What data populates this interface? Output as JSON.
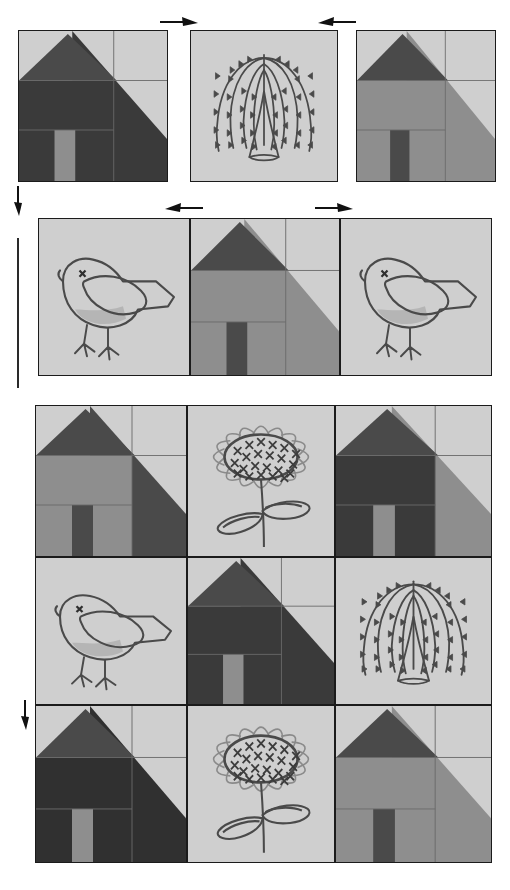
{
  "document": {
    "type": "quilt-block-layout-diagram",
    "title": "Schoolhouse quilt assembly diagram",
    "description": "Rows of pieced house blocks alternating with appliqued willow, bird and sunflower blocks, with arrows showing seam pressing directions."
  },
  "palette": {
    "fabric_light": "#cfcfcf",
    "fabric_light2": "#c4c4c4",
    "fabric_mid": "#8e8e8e",
    "fabric_mid_dark": "#7a7a7a",
    "fabric_dark": "#4a4a4a",
    "fabric_darker": "#3a3a3a",
    "fabric_darkest": "#303030",
    "outline": "#1b1b1b",
    "applique_line": "#4a4a4a",
    "arrow": "#111111",
    "background": "#ffffff"
  },
  "rows": [
    {
      "id": "row-1",
      "label": "Row 1",
      "blocks": [
        {
          "id": "r1c1",
          "kind": "house",
          "name": "house-block-dark",
          "roof": "#4a4a4a",
          "wall": "#3a3a3a",
          "door": "#8e8e8e",
          "sky": "#cfcfcf",
          "side": "#3a3a3a",
          "x": 18,
          "y": 30,
          "w": 150,
          "h": 152
        },
        {
          "id": "r1c2",
          "kind": "willow",
          "name": "willow-tree-block",
          "ground": "#cfcfcf",
          "x": 190,
          "y": 30,
          "w": 148,
          "h": 152
        },
        {
          "id": "r1c3",
          "kind": "house",
          "name": "house-block-mid",
          "roof": "#4a4a4a",
          "wall": "#8e8e8e",
          "door": "#4a4a4a",
          "sky": "#cfcfcf",
          "side": "#8e8e8e",
          "x": 356,
          "y": 30,
          "w": 140,
          "h": 152
        }
      ]
    },
    {
      "id": "row-2",
      "label": "Row 2",
      "blocks": [
        {
          "id": "r2c1",
          "kind": "bird",
          "name": "bird-block",
          "ground": "#cfcfcf",
          "x": 38,
          "y": 218,
          "w": 152,
          "h": 158
        },
        {
          "id": "r2c2",
          "kind": "house",
          "name": "house-block-mid",
          "roof": "#4a4a4a",
          "wall": "#8e8e8e",
          "door": "#4a4a4a",
          "sky": "#cfcfcf",
          "side": "#8e8e8e",
          "x": 190,
          "y": 218,
          "w": 150,
          "h": 158
        },
        {
          "id": "r2c3",
          "kind": "bird",
          "name": "bird-block",
          "ground": "#cfcfcf",
          "x": 340,
          "y": 218,
          "w": 152,
          "h": 158
        }
      ]
    },
    {
      "id": "row-3",
      "label": "Row 3",
      "blocks": [
        {
          "id": "r3c1",
          "kind": "house",
          "name": "house-block-mid",
          "roof": "#4a4a4a",
          "wall": "#8e8e8e",
          "door": "#4a4a4a",
          "sky": "#cfcfcf",
          "side": "#4a4a4a",
          "x": 35,
          "y": 405,
          "w": 152,
          "h": 152
        },
        {
          "id": "r3c2",
          "kind": "sunflower",
          "name": "sunflower-block",
          "ground": "#cfcfcf",
          "x": 187,
          "y": 405,
          "w": 148,
          "h": 152
        },
        {
          "id": "r3c3",
          "kind": "house",
          "name": "house-block-dark",
          "roof": "#4a4a4a",
          "wall": "#3a3a3a",
          "door": "#8e8e8e",
          "sky": "#cfcfcf",
          "side": "#8e8e8e",
          "x": 335,
          "y": 405,
          "w": 157,
          "h": 152
        }
      ]
    },
    {
      "id": "row-4",
      "label": "Row 4",
      "blocks": [
        {
          "id": "r4c1",
          "kind": "bird",
          "name": "bird-block",
          "ground": "#cfcfcf",
          "x": 35,
          "y": 557,
          "w": 152,
          "h": 148
        },
        {
          "id": "r4c2",
          "kind": "house",
          "name": "house-block-dark",
          "roof": "#4a4a4a",
          "wall": "#3a3a3a",
          "door": "#8e8e8e",
          "sky": "#cfcfcf",
          "side": "#3a3a3a",
          "x": 187,
          "y": 557,
          "w": 148,
          "h": 148
        },
        {
          "id": "r4c3",
          "kind": "willow",
          "name": "willow-tree-block",
          "ground": "#cfcfcf",
          "x": 335,
          "y": 557,
          "w": 157,
          "h": 148
        }
      ]
    },
    {
      "id": "row-5",
      "label": "Row 5",
      "blocks": [
        {
          "id": "r5c1",
          "kind": "house",
          "name": "house-block-darkest",
          "roof": "#4a4a4a",
          "wall": "#303030",
          "door": "#8e8e8e",
          "sky": "#cfcfcf",
          "side": "#303030",
          "x": 35,
          "y": 705,
          "w": 152,
          "h": 158
        },
        {
          "id": "r5c2",
          "kind": "sunflower",
          "name": "sunflower-block",
          "ground": "#cfcfcf",
          "x": 187,
          "y": 705,
          "w": 148,
          "h": 158
        },
        {
          "id": "r5c3",
          "kind": "house",
          "name": "house-block-mid",
          "roof": "#4a4a4a",
          "wall": "#8e8e8e",
          "door": "#4a4a4a",
          "sky": "#cfcfcf",
          "side": "#8e8e8e",
          "x": 335,
          "y": 705,
          "w": 157,
          "h": 158
        }
      ]
    }
  ],
  "arrows": [
    {
      "id": "a1",
      "name": "arrow-right-row1-left",
      "direction": "right",
      "x": 160,
      "y": 14,
      "len": 38
    },
    {
      "id": "a2",
      "name": "arrow-left-row1-right",
      "direction": "left",
      "x": 318,
      "y": 14,
      "len": 38
    },
    {
      "id": "a3",
      "name": "arrow-down-left-upper",
      "direction": "down",
      "x": 10,
      "y": 186,
      "len": 30
    },
    {
      "id": "a4",
      "name": "arrow-left-row2-left",
      "direction": "left",
      "x": 165,
      "y": 200,
      "len": 38
    },
    {
      "id": "a5",
      "name": "arrow-right-row2-right",
      "direction": "right",
      "x": 315,
      "y": 200,
      "len": 38
    },
    {
      "id": "a6",
      "name": "arrow-down-left-lower",
      "direction": "down",
      "x": 17,
      "y": 700,
      "len": 30
    }
  ],
  "guides": [
    {
      "id": "g1",
      "name": "vertical-guide-line",
      "x": 17,
      "y": 238,
      "w": 1.6,
      "h": 150
    }
  ]
}
